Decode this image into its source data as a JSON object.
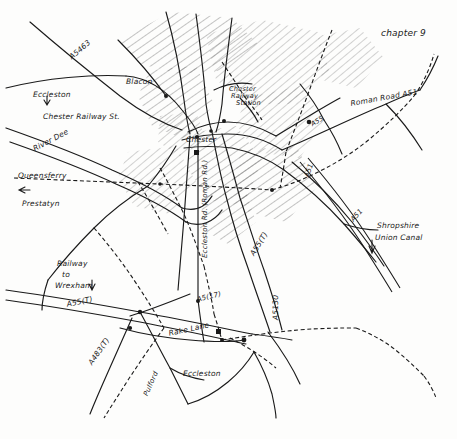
{
  "document": {
    "kind": "hand-drawn sketch map",
    "title": "chapter 9",
    "subject": "Chester and surrounding road, rail and waterway network",
    "ink_color": "#1a1a1a",
    "paper_color": "#fdfdfc"
  },
  "header": {
    "chapter_label": "chapter 9"
  },
  "places": [
    {
      "name": "Blacon",
      "x": 126,
      "y": 78,
      "rotate": 0,
      "size": 7.5
    },
    {
      "name": "Chester",
      "x": 186,
      "y": 136,
      "rotate": 0,
      "size": 7.5
    },
    {
      "name": "Chester",
      "x": 229,
      "y": 86,
      "rotate": 0,
      "size": 6.6
    },
    {
      "name": "Railway",
      "x": 231,
      "y": 93,
      "rotate": 0,
      "size": 6.6
    },
    {
      "name": "Station",
      "x": 236,
      "y": 100,
      "rotate": 0,
      "size": 6.6
    },
    {
      "name": "Queensferry",
      "x": 18,
      "y": 172,
      "rotate": 0,
      "size": 7.5
    },
    {
      "name": "Prestatyn",
      "x": 22,
      "y": 200,
      "rotate": 0,
      "size": 7.5
    },
    {
      "name": "Eccleston",
      "x": 183,
      "y": 370,
      "rotate": 0,
      "size": 7.5
    }
  ],
  "annotations": [
    {
      "text": "Eccleston",
      "x": 33,
      "y": 91,
      "rotate": 0,
      "size": 7.5
    },
    {
      "text": "Chester Railway St.",
      "x": 43,
      "y": 113,
      "rotate": 0,
      "size": 7.5
    },
    {
      "text": "Railway",
      "x": 57,
      "y": 260,
      "rotate": 0,
      "size": 7.5
    },
    {
      "text": "to",
      "x": 62,
      "y": 271,
      "rotate": 0,
      "size": 7.5
    },
    {
      "text": "Wrexham",
      "x": 55,
      "y": 282,
      "rotate": 0,
      "size": 7.5
    },
    {
      "text": "Shropshire",
      "x": 377,
      "y": 222,
      "rotate": 0,
      "size": 7.5
    },
    {
      "text": "Union Canal",
      "x": 375,
      "y": 234,
      "rotate": 0,
      "size": 7.5
    }
  ],
  "roads": [
    {
      "label": "A5463",
      "x": 68,
      "y": 55,
      "rotate": -40,
      "size": 7.5
    },
    {
      "label": "Roman Road A51",
      "x": 350,
      "y": 100,
      "rotate": -10,
      "size": 7.5
    },
    {
      "label": "River Dee",
      "x": 32,
      "y": 146,
      "rotate": -28,
      "size": 7.5
    },
    {
      "label": "A51",
      "x": 303,
      "y": 176,
      "rotate": -72,
      "size": 7.0
    },
    {
      "label": "A55",
      "x": 310,
      "y": 122,
      "rotate": -30,
      "size": 6.5
    },
    {
      "label": "A51",
      "x": 349,
      "y": 218,
      "rotate": -48,
      "size": 7.0
    },
    {
      "label": "A55(T)",
      "x": 249,
      "y": 253,
      "rotate": -58,
      "size": 7.5
    },
    {
      "label": "A55(T)",
      "x": 66,
      "y": 301,
      "rotate": -12,
      "size": 7.5
    },
    {
      "label": "A483(T)",
      "x": 87,
      "y": 362,
      "rotate": -55,
      "size": 7.5
    },
    {
      "label": "A5130",
      "x": 272,
      "y": 320,
      "rotate": -90,
      "size": 7.5
    },
    {
      "label": "A5(17)",
      "x": 196,
      "y": 296,
      "rotate": -14,
      "size": 7.0
    },
    {
      "label": "Rake Lane",
      "x": 168,
      "y": 330,
      "rotate": -12,
      "size": 7.5
    },
    {
      "label": "Eccleston Rd. (Roman Rd.)",
      "x": 201,
      "y": 258,
      "rotate": -90,
      "size": 7.0
    },
    {
      "label": "Pulford",
      "x": 142,
      "y": 394,
      "rotate": -66,
      "size": 7.0
    }
  ],
  "arrows": [
    {
      "name": "eccleston-to-chester-arrow",
      "x": 47,
      "y": 101
    },
    {
      "name": "railway-to-wrexham-arrow",
      "x": 92,
      "y": 287
    },
    {
      "name": "shropshire-canal-arrow",
      "x": 372,
      "y": 247
    },
    {
      "name": "prestatyn-arrow",
      "x": 24,
      "y": 190
    }
  ],
  "legend_features": {
    "railway_style": "cross-hatched line",
    "road_style": "plain single line",
    "urban_style": "diagonal hatching",
    "water_style": "double line"
  }
}
